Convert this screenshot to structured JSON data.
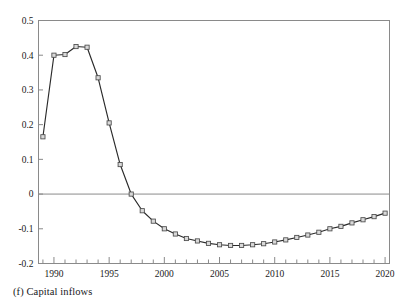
{
  "figure": {
    "caption": "(f) Capital inflows",
    "panel_letter": "(f)",
    "panel_title": "Capital inflows"
  },
  "colors": {
    "axis": "#8a8a8a",
    "zero_line": "#8a8a8a",
    "series_line": "#2a2a2a",
    "marker_fill": "#d9d9d9",
    "marker_stroke": "#4a4a4a",
    "text": "#1a1a1a",
    "background": "#ffffff"
  },
  "chart_data": {
    "type": "line",
    "title": "",
    "subtitle": "",
    "xlabel": "",
    "ylabel": "",
    "xlim": [
      1988.6,
      2020.4
    ],
    "ylim": [
      -0.2,
      0.5
    ],
    "grid": false,
    "legend_position": "none",
    "zero_line": 0,
    "ytick_labels": [
      "0.5",
      "0.4",
      "0.3",
      "0.2",
      "0.1",
      "0",
      "-0.1",
      "-0.2"
    ],
    "ytick_values": [
      0.5,
      0.4,
      0.3,
      0.2,
      0.1,
      0,
      -0.1,
      -0.2
    ],
    "xtick_labels": [
      "1990",
      "1995",
      "2000",
      "2005",
      "2010",
      "2015",
      "2020"
    ],
    "xtick_values": [
      1990,
      1995,
      2000,
      2005,
      2010,
      2015,
      2020
    ],
    "xtick_minor_interval": 1,
    "marker_style": "open-square",
    "series": [
      {
        "name": "Capital inflows",
        "x": [
          1989,
          1990,
          1991,
          1992,
          1993,
          1994,
          1995,
          1996,
          1997,
          1998,
          1999,
          2000,
          2001,
          2002,
          2003,
          2004,
          2005,
          2006,
          2007,
          2008,
          2009,
          2010,
          2011,
          2012,
          2013,
          2014,
          2015,
          2016,
          2017,
          2018,
          2019,
          2020
        ],
        "values": [
          0.165,
          0.4,
          0.402,
          0.425,
          0.423,
          0.335,
          0.205,
          0.085,
          0.0,
          -0.048,
          -0.078,
          -0.1,
          -0.115,
          -0.128,
          -0.135,
          -0.142,
          -0.146,
          -0.148,
          -0.148,
          -0.146,
          -0.143,
          -0.138,
          -0.132,
          -0.125,
          -0.118,
          -0.11,
          -0.1,
          -0.093,
          -0.083,
          -0.074,
          -0.065,
          -0.055
        ]
      }
    ]
  }
}
